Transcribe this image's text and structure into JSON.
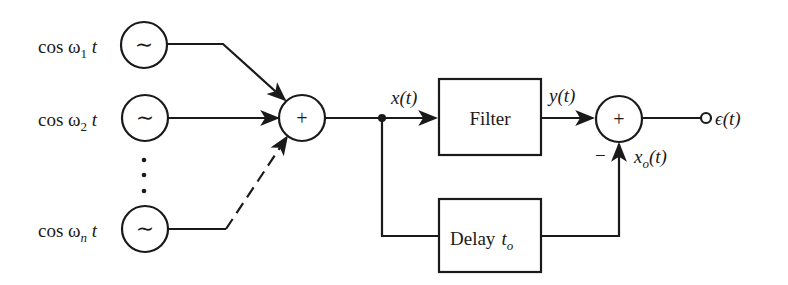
{
  "diagram": {
    "type": "signal-flow block diagram",
    "sources": [
      {
        "id": "osc1",
        "label_prefix": "cos ω",
        "subscript": "1",
        "label_suffix": " t",
        "icon": "sine-wave-icon"
      },
      {
        "id": "osc2",
        "label_prefix": "cos ω",
        "subscript": "2",
        "label_suffix": " t",
        "icon": "sine-wave-icon"
      },
      {
        "id": "oscn",
        "label_prefix": "cos ω",
        "subscript": "n",
        "label_suffix": " t",
        "icon": "sine-wave-icon"
      }
    ],
    "ellipsis": "⋮",
    "summer1": {
      "symbol": "+"
    },
    "signals": {
      "x": "x(t)",
      "y": "y(t)",
      "xo_main": "x",
      "xo_sub": "o",
      "xo_tail": "(t)",
      "eps": "ϵ(t)"
    },
    "filter": {
      "label": "Filter"
    },
    "delay": {
      "label": "Delay",
      "param_main": "t",
      "param_sub": "o"
    },
    "summer2": {
      "symbol": "+",
      "minus_sign": "−"
    },
    "sine_glyph": "∼",
    "colors": {
      "ink": "#1a1a1a",
      "background": "#ffffff"
    }
  }
}
